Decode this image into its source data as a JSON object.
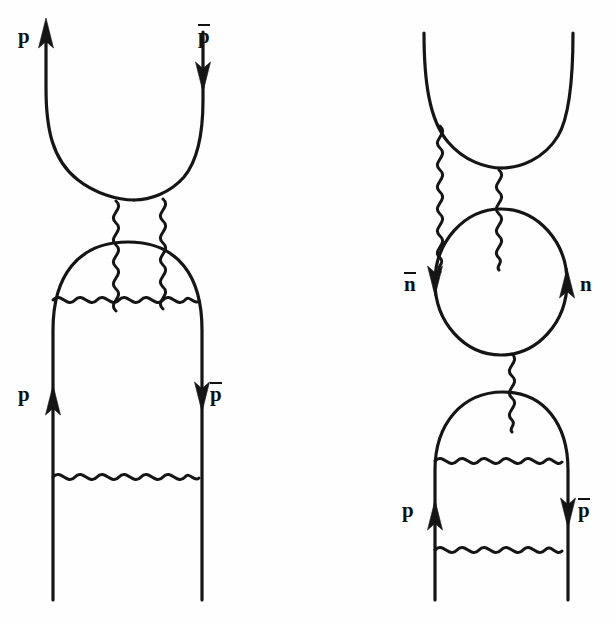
{
  "figure": {
    "kind": "feynman-diagram-pair",
    "background_color": "#fefefe",
    "ink_color": "#151515",
    "width": 616,
    "height": 623
  },
  "diagrams": [
    {
      "id": "left-diagram",
      "name": "proton-antiproton-annihilation-two-boson-exchange",
      "labels": [
        {
          "id": "top-left",
          "text": "p",
          "bar": false,
          "x": 18,
          "y": 26,
          "arrow": "up"
        },
        {
          "id": "top-right",
          "text": "p",
          "bar": true,
          "x": 198,
          "y": 24,
          "arrow": "down"
        },
        {
          "id": "bottom-left",
          "text": "p",
          "bar": false,
          "x": 18,
          "y": 384,
          "arrow": "up"
        },
        {
          "id": "bottom-right",
          "text": "p",
          "bar": true,
          "x": 198,
          "y": 382,
          "arrow": "down"
        }
      ],
      "boson_count_vertical": 2,
      "boson_count_horizontal": 2
    },
    {
      "id": "right-diagram",
      "name": "neutron-antineutron-loop-exchange",
      "labels": [
        {
          "id": "loop-left",
          "text": "n",
          "bar": true,
          "x": 394,
          "y": 272,
          "arrow": "down"
        },
        {
          "id": "loop-right",
          "text": "n",
          "bar": false,
          "x": 578,
          "y": 272,
          "arrow": "up"
        },
        {
          "id": "bottom-left",
          "text": "p",
          "bar": false,
          "x": 398,
          "y": 500,
          "arrow": "up"
        },
        {
          "id": "bottom-right",
          "text": "p",
          "bar": true,
          "x": 578,
          "y": 498,
          "arrow": "down"
        }
      ],
      "boson_count_vertical": 3,
      "boson_count_horizontal": 2
    }
  ],
  "legend": {
    "solid_line_meaning": "fermion (baryon) line",
    "wavy_line_meaning": "boson exchange (gluon / meson)",
    "arrow_meaning": "direction of particle flow"
  }
}
